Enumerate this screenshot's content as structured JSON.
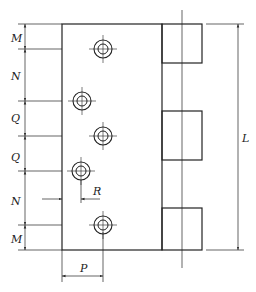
{
  "diagram": {
    "colors": {
      "line": "#222222",
      "background": "#ffffff"
    },
    "plate": {
      "x": 62,
      "y": 24,
      "width": 100,
      "height": 226
    },
    "knuckles": [
      {
        "x": 162,
        "y": 24,
        "width": 40,
        "height": 39
      },
      {
        "x": 162,
        "y": 111,
        "width": 40,
        "height": 49
      },
      {
        "x": 162,
        "y": 208,
        "width": 40,
        "height": 42
      }
    ],
    "pin_centerline": {
      "x": 182,
      "y1": 10,
      "y2": 268
    },
    "holes": [
      {
        "cx": 103,
        "cy": 49,
        "r_outer": 9,
        "r_inner": 5
      },
      {
        "cx": 82,
        "cy": 101,
        "r_outer": 9,
        "r_inner": 5
      },
      {
        "cx": 103,
        "cy": 136,
        "r_outer": 9,
        "r_inner": 5
      },
      {
        "cx": 81,
        "cy": 171,
        "r_outer": 9,
        "r_inner": 5
      },
      {
        "cx": 103,
        "cy": 225,
        "r_outer": 9,
        "r_inner": 5
      }
    ],
    "dimensions": {
      "left_chain": {
        "x": 25,
        "stops": [
          24,
          49,
          101,
          136,
          171,
          225,
          250
        ],
        "labels": [
          {
            "text": "M",
            "x": 11,
            "y": 42
          },
          {
            "text": "N",
            "x": 11,
            "y": 80
          },
          {
            "text": "Q",
            "x": 11,
            "y": 122
          },
          {
            "text": "Q",
            "x": 11,
            "y": 161
          },
          {
            "text": "N",
            "x": 11,
            "y": 205
          },
          {
            "text": "M",
            "x": 11,
            "y": 243
          }
        ]
      },
      "L": {
        "label": "L",
        "x": 238,
        "y1": 24,
        "y2": 250,
        "label_x": 242,
        "label_y": 142
      },
      "P": {
        "label": "P",
        "y": 276,
        "x1": 62,
        "x2": 103,
        "label_x": 80,
        "label_y": 272
      },
      "R": {
        "label": "R",
        "y": 199,
        "x1": 62,
        "x2": 81,
        "label_x": 93,
        "label_y": 195
      }
    }
  }
}
